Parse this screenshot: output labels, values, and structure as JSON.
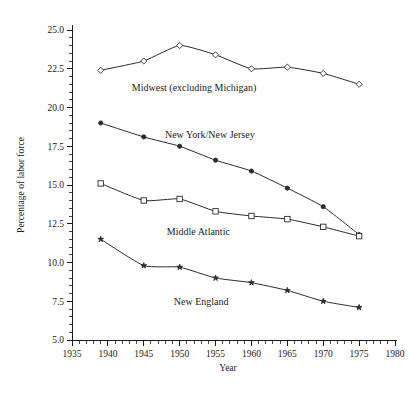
{
  "chart_data": {
    "type": "line",
    "title": "",
    "xlabel": "Year",
    "ylabel": "Percentage of labor force",
    "xlim": [
      1935,
      1980
    ],
    "ylim": [
      5.0,
      25.0
    ],
    "grid": false,
    "legend_position": "inline-annotations",
    "x_ticks": [
      1935,
      1940,
      1945,
      1950,
      1955,
      1960,
      1965,
      1970,
      1975,
      1980
    ],
    "x_tick_labels": [
      "1935",
      "1940",
      "1945",
      "1950",
      "1955",
      "1960",
      "1965",
      "1970",
      "1975",
      "1980"
    ],
    "x_minor_tick_step": 1,
    "y_ticks": [
      5.0,
      7.5,
      10.0,
      12.5,
      15.0,
      17.5,
      20.0,
      22.5,
      25.0
    ],
    "y_tick_labels": [
      "5.0",
      "7.5",
      "10.0",
      "12.5",
      "15.0",
      "17.5",
      "20.0",
      "22.5",
      "25.0"
    ],
    "y_minor_tick_step": 0.5,
    "x": [
      1939,
      1945,
      1950,
      1955,
      1960,
      1965,
      1970,
      1975
    ],
    "series": [
      {
        "name": "Midwest (excluding Michigan)",
        "marker": "open-diamond",
        "color": "#2b2b2b",
        "values": [
          22.4,
          23.0,
          24.0,
          23.4,
          22.5,
          22.6,
          22.2,
          21.5
        ],
        "label_x": 1952.0,
        "label_y": 21.05
      },
      {
        "name": "New York/New Jersey",
        "marker": "filled-circle",
        "color": "#2b2b2b",
        "values": [
          19.0,
          18.1,
          17.5,
          16.6,
          15.9,
          14.8,
          13.6,
          11.8
        ],
        "label_x": 1954.2,
        "label_y": 18.05
      },
      {
        "name": "Middle Atlantic",
        "marker": "open-square",
        "color": "#2b2b2b",
        "values": [
          15.1,
          14.0,
          14.1,
          13.3,
          13.0,
          12.8,
          12.3,
          11.7
        ],
        "label_x": 1952.6,
        "label_y": 11.75
      },
      {
        "name": "New England",
        "marker": "filled-star",
        "color": "#2b2b2b",
        "values": [
          11.5,
          9.8,
          9.7,
          9.0,
          8.7,
          8.2,
          7.5,
          7.1
        ],
        "label_x": 1953.0,
        "label_y": 7.25
      }
    ]
  },
  "axes": {
    "y_axis_title": "Percentage of labor force",
    "x_axis_title": "Year"
  },
  "annotations": {
    "midwest": "Midwest (excluding Michigan)",
    "ny_nj": "New York/New Jersey",
    "middle_atlantic": "Middle Atlantic",
    "new_england": "New England"
  },
  "caption": {
    "partial_text": ""
  }
}
